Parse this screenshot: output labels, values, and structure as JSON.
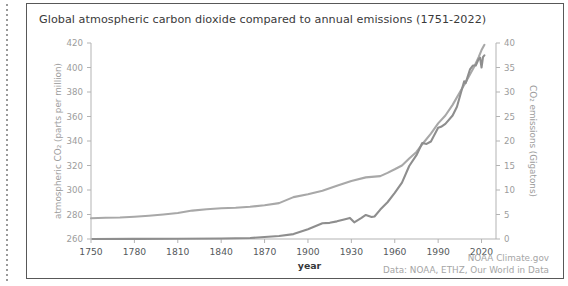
{
  "figure": {
    "title": "Global atmospheric carbon dioxide compared to annual emissions (1751-2022)",
    "credit_line_1": "NOAA Climate.gov",
    "credit_line_2": "Data: NOAA, ETHZ, Our World in Data"
  },
  "chart_data": {
    "type": "line",
    "title": "Global atmospheric carbon dioxide compared to annual emissions (1751-2022)",
    "xlabel": "year",
    "ylabel": "atmospheric CO₂ (parts per million)",
    "y2label": "CO₂ emissions (Gigatons)",
    "xlim": [
      1750,
      2030
    ],
    "ylim": [
      260,
      420
    ],
    "y2lim": [
      0,
      40
    ],
    "grid": false,
    "legend": "none",
    "xticks": [
      1750,
      1780,
      1810,
      1840,
      1870,
      1900,
      1930,
      1960,
      1990,
      2020
    ],
    "xtick_labels": [
      "1750",
      "1780",
      "1810",
      "1840",
      "1870",
      "1900",
      "1930",
      "1960",
      "1990",
      "2020"
    ],
    "yticks": [
      260,
      280,
      300,
      320,
      340,
      360,
      380,
      400,
      420
    ],
    "ytick_labels": [
      "260",
      "280",
      "300",
      "320",
      "340",
      "360",
      "380",
      "400",
      "420"
    ],
    "y2ticks": [
      0,
      5,
      10,
      15,
      20,
      25,
      30,
      35,
      40
    ],
    "y2tick_labels": [
      "0",
      "5",
      "10",
      "15",
      "20",
      "25",
      "30",
      "35",
      "40"
    ],
    "colors": {
      "co2_concentration": "#a8a8a8",
      "emissions": "#8e8e8e",
      "axis": "#b3b3b3",
      "tick_text": "#9c9c9c",
      "title_text": "#3a3a3a",
      "credit_text": "#a5a5a5",
      "border": "#585858"
    },
    "series": [
      {
        "name": "atmospheric CO2 concentration",
        "axis": "left",
        "unit": "parts per million",
        "x": [
          1750,
          1760,
          1770,
          1780,
          1790,
          1800,
          1810,
          1820,
          1830,
          1840,
          1850,
          1860,
          1870,
          1880,
          1890,
          1900,
          1910,
          1920,
          1930,
          1940,
          1950,
          1955,
          1960,
          1965,
          1970,
          1975,
          1980,
          1985,
          1990,
          1995,
          2000,
          2005,
          2010,
          2015,
          2018,
          2020,
          2022
        ],
        "values": [
          277.0,
          277.3,
          277.6,
          278.2,
          279.0,
          280.0,
          281.2,
          283.2,
          284.3,
          285.1,
          285.5,
          286.3,
          287.6,
          289.3,
          294.2,
          296.5,
          299.4,
          303.4,
          307.4,
          310.3,
          311.3,
          314.0,
          316.9,
          320.0,
          325.7,
          331.1,
          338.8,
          346.0,
          354.4,
          360.8,
          369.5,
          379.8,
          389.9,
          400.8,
          408.5,
          414.2,
          418.5
        ]
      },
      {
        "name": "annual CO2 emissions",
        "axis": "right",
        "unit": "Gigatons",
        "x": [
          1751,
          1780,
          1810,
          1840,
          1860,
          1870,
          1880,
          1890,
          1900,
          1910,
          1915,
          1920,
          1925,
          1929,
          1932,
          1937,
          1940,
          1944,
          1946,
          1950,
          1955,
          1960,
          1965,
          1970,
          1975,
          1979,
          1982,
          1985,
          1990,
          1992,
          1995,
          2000,
          2003,
          2008,
          2009,
          2012,
          2014,
          2016,
          2018,
          2019,
          2020,
          2021,
          2022
        ],
        "values": [
          0.01,
          0.02,
          0.04,
          0.1,
          0.2,
          0.4,
          0.6,
          1.0,
          2.0,
          3.2,
          3.3,
          3.6,
          4.0,
          4.3,
          3.4,
          4.3,
          4.9,
          4.5,
          4.6,
          6.0,
          7.5,
          9.4,
          11.5,
          14.9,
          17.1,
          19.6,
          19.4,
          19.9,
          22.7,
          22.9,
          23.5,
          25.2,
          27.0,
          32.2,
          31.8,
          34.6,
          35.4,
          35.4,
          36.7,
          37.0,
          35.0,
          37.1,
          37.5
        ]
      }
    ]
  }
}
